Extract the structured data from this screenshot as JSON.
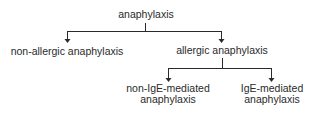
{
  "diagram": {
    "type": "tree",
    "root": {
      "label": "anaphylaxis",
      "children": [
        {
          "label": "non-allergic anaphylaxis"
        },
        {
          "label": "allergic anaphylaxis",
          "children": [
            {
              "label_line1": "non-IgE-mediated",
              "label_line2": "anaphylaxis"
            },
            {
              "label_line1": "IgE-mediated",
              "label_line2": "anaphylaxis"
            }
          ]
        }
      ]
    },
    "line_color": "#2a2a2a"
  }
}
